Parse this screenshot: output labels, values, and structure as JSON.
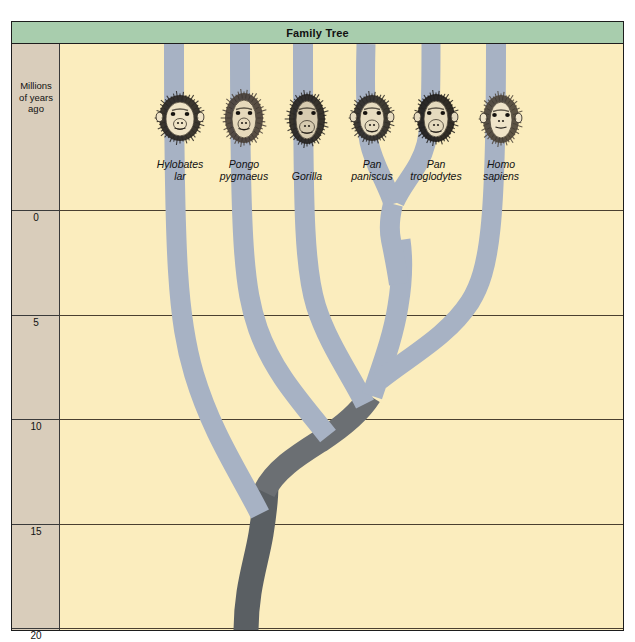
{
  "title": "Family Tree",
  "axis": {
    "label": "Millions\nof years\nago",
    "label_lines": [
      "Millions",
      "of years",
      "ago"
    ],
    "unit": "millions of years ago",
    "ticks": [
      0,
      5,
      10,
      15,
      20
    ],
    "tick_labels": [
      "0",
      "5",
      "10",
      "15",
      "20"
    ]
  },
  "colors": {
    "header_green": "#a8cdad",
    "plot_background": "#fbedbe",
    "scale_background": "#d9cdbb",
    "branch_light": "#a7b2c4",
    "branch_dark": "#6b6f73",
    "trunk_dark": "#5a5f63",
    "gridline": "#4a4030",
    "border": "#1d1d1d"
  },
  "taxa": [
    {
      "id": "hylobates",
      "genus": "Hylobates",
      "species": "lar",
      "icon": "gibbon-head-icon",
      "x": 168
    },
    {
      "id": "pongo",
      "genus": "Pongo",
      "species": "pygmaeus",
      "icon": "orangutan-head-icon",
      "x": 232
    },
    {
      "id": "gorilla",
      "genus": "Gorilla",
      "species": "",
      "icon": "gorilla-head-icon",
      "x": 295
    },
    {
      "id": "paniscus",
      "genus": "Pan",
      "species": "paniscus",
      "icon": "bonobo-head-icon",
      "x": 360
    },
    {
      "id": "troglodytes",
      "genus": "Pan",
      "species": "troglodytes",
      "icon": "chimpanzee-head-icon",
      "x": 424
    },
    {
      "id": "homo",
      "genus": "Homo",
      "species": "sapiens",
      "icon": "human-head-icon",
      "x": 489
    }
  ],
  "chart_data": {
    "type": "tree",
    "title": "Family Tree",
    "xlabel": "",
    "ylabel": "Millions of years ago",
    "ylim": [
      0,
      22
    ],
    "grid": true,
    "legend": "none",
    "orientation": "vertical-root-at-bottom",
    "tips": [
      "Hylobates lar",
      "Pongo pygmaeus",
      "Gorilla",
      "Pan paniscus",
      "Pan troglodytes",
      "Homo sapiens"
    ],
    "divergences": [
      {
        "node": "hominoid-root",
        "age_mya": 18.0,
        "splits": [
          "Hylobates lar",
          "great-ape clade"
        ]
      },
      {
        "node": "great-ape-root",
        "age_mya": 14.0,
        "splits": [
          "Pongo pygmaeus",
          "African-ape clade"
        ]
      },
      {
        "node": "african-ape-root",
        "age_mya": 9.0,
        "splits": [
          "Gorilla",
          "Pan-Homo clade"
        ]
      },
      {
        "node": "pan-homo",
        "age_mya": 6.5,
        "splits": [
          "Homo sapiens",
          "Pan clade"
        ]
      },
      {
        "node": "pan-split",
        "age_mya": 2.5,
        "splits": [
          "Pan paniscus",
          "Pan troglodytes"
        ]
      }
    ]
  }
}
